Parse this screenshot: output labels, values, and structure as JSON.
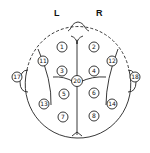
{
  "diagram": {
    "type": "eeg-electrode-placement-top-view",
    "labels": {
      "left": "L",
      "right": "R"
    },
    "colors": {
      "stroke": "#222222",
      "background": "#ffffff"
    },
    "electrodes": [
      {
        "id": "1",
        "x": 62,
        "y": 47
      },
      {
        "id": "2",
        "x": 94,
        "y": 47
      },
      {
        "id": "11",
        "x": 43,
        "y": 61
      },
      {
        "id": "12",
        "x": 112,
        "y": 61
      },
      {
        "id": "3",
        "x": 62,
        "y": 71
      },
      {
        "id": "4",
        "x": 94,
        "y": 71
      },
      {
        "id": "20",
        "x": 77,
        "y": 81
      },
      {
        "id": "5",
        "x": 64,
        "y": 94
      },
      {
        "id": "6",
        "x": 94,
        "y": 93
      },
      {
        "id": "13",
        "x": 44,
        "y": 104
      },
      {
        "id": "14",
        "x": 112,
        "y": 104
      },
      {
        "id": "7",
        "x": 63,
        "y": 117
      },
      {
        "id": "8",
        "x": 94,
        "y": 116
      },
      {
        "id": "17",
        "x": 17,
        "y": 77
      },
      {
        "id": "18",
        "x": 135,
        "y": 77
      }
    ]
  }
}
